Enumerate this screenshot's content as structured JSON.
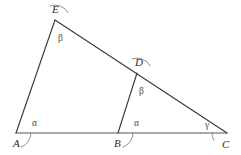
{
  "figure": {
    "background_color": "#ffffff",
    "line_color": "#3a3a3a",
    "baseline_color": "#555555",
    "arc_color": "#7b7b7b",
    "label_color": "#2b2b2b",
    "angle_label_color": "#4a4a4a"
  },
  "points": [
    {
      "id": "A",
      "label": "A",
      "x": 16,
      "y": 133,
      "label_x": 13,
      "label_y": 147
    },
    {
      "id": "B",
      "label": "B",
      "x": 118,
      "y": 133,
      "label_x": 114,
      "label_y": 147
    },
    {
      "id": "C",
      "label": "C",
      "x": 227,
      "y": 133,
      "label_x": 222,
      "label_y": 148
    },
    {
      "id": "D",
      "label": "D",
      "x": 137,
      "y": 73,
      "label_x": 135,
      "label_y": 66
    },
    {
      "id": "E",
      "label": "E",
      "x": 55,
      "y": 20,
      "label_x": 52,
      "label_y": 13
    }
  ],
  "segments": [
    {
      "id": "AC",
      "from": "A",
      "to": "C",
      "style": "baseline"
    },
    {
      "id": "AE",
      "from": "A",
      "to": "E",
      "style": "normal"
    },
    {
      "id": "EC",
      "from": "E",
      "to": "C",
      "style": "normal"
    },
    {
      "id": "BD",
      "from": "B",
      "to": "D",
      "style": "normal"
    }
  ],
  "angles": [
    {
      "id": "angle-A",
      "vertex": "A",
      "label": "α",
      "label_x": 32,
      "label_y": 126,
      "radius": 15,
      "start_deg": 0,
      "end_deg": -70.9
    },
    {
      "id": "angle-B",
      "vertex": "B",
      "label": "α",
      "label_x": 134,
      "label_y": 126,
      "radius": 15,
      "start_deg": 0,
      "end_deg": -70.9
    },
    {
      "id": "angle-E",
      "vertex": "E",
      "label": "β",
      "label_x": 58,
      "label_y": 41,
      "radius": 15,
      "start_deg": 109.1,
      "end_deg": 29.1
    },
    {
      "id": "angle-D",
      "vertex": "D",
      "label": "β",
      "label_x": 139,
      "label_y": 94,
      "radius": 15,
      "start_deg": 109.1,
      "end_deg": 29.1
    },
    {
      "id": "angle-C",
      "vertex": "C",
      "label": "γ",
      "label_x": 205,
      "label_y": 128,
      "radius": 15,
      "start_deg": 180,
      "end_deg": 209.1
    }
  ]
}
